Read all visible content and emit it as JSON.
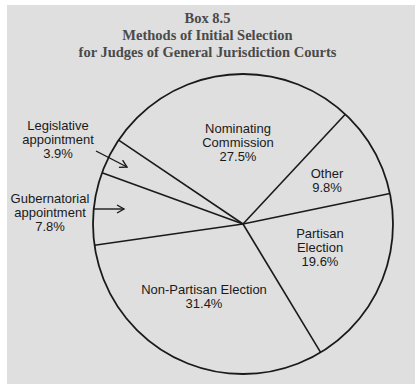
{
  "title": {
    "line1": "Box 8.5",
    "line2": "Methods of Initial Selection",
    "line3": "for Judges of General Jurisdiction Courts"
  },
  "colors": {
    "background": "#dfdfdf",
    "outer_margin": "#ffffff",
    "title_text": "#4a4a4a",
    "stroke": "#1a1a1a",
    "label_text": "#1a1a1a"
  },
  "chart_data": {
    "type": "pie",
    "title": "Box 8.5 Methods of Initial Selection for Judges of General Jurisdiction Courts",
    "fill": "none",
    "start_angle_deg": -47,
    "direction": "clockwise",
    "center": [
      243,
      224
    ],
    "radius": 150,
    "slices": [
      {
        "label": "Other",
        "value": 9.8,
        "label_lines": [
          "Other",
          "9.8%"
        ],
        "label_pos": [
          327,
          178
        ],
        "anchor": "middle"
      },
      {
        "label": "Partisan Election",
        "value": 19.6,
        "label_lines": [
          "Partisan",
          "Election",
          "19.6%"
        ],
        "label_pos": [
          320,
          238
        ],
        "anchor": "middle"
      },
      {
        "label": "Non-Partisan Election",
        "value": 31.4,
        "label_lines": [
          "Non-Partisan Election",
          "31.4%"
        ],
        "label_pos": [
          204,
          294
        ],
        "anchor": "middle"
      },
      {
        "label": "Gubernatorial appointment",
        "value": 7.8,
        "label_lines": [
          "Gubernatorial",
          "appointment",
          "7.8%"
        ],
        "label_pos": [
          50,
          203
        ],
        "anchor": "middle",
        "external": true,
        "arrow": [
          [
            93,
            209
          ],
          [
            124,
            209
          ]
        ]
      },
      {
        "label": "Legislative appointment",
        "value": 3.9,
        "label_lines": [
          "Legislative",
          "appointment",
          "3.9%"
        ],
        "label_pos": [
          58,
          130
        ],
        "anchor": "middle",
        "external": true,
        "arrow": [
          [
            96,
            151
          ],
          [
            127,
            167
          ]
        ]
      },
      {
        "label": "Nominating Commission",
        "value": 27.5,
        "label_lines": [
          "Nominating",
          "Commission",
          "27.5%"
        ],
        "label_pos": [
          238,
          133
        ],
        "anchor": "middle"
      }
    ],
    "legend": "none",
    "grid": false
  }
}
